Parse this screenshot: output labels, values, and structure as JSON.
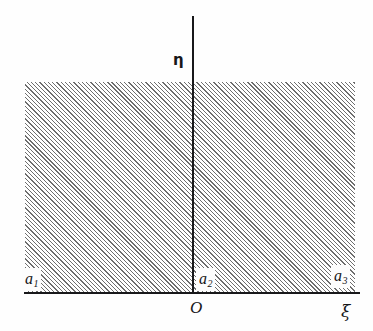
{
  "figure": {
    "type": "coordinate-plane-diagram",
    "background_color": "#fefefe",
    "hatch_color": "#6e6e6e",
    "axis_color": "#18181a"
  },
  "axes": {
    "horizontal": {
      "label": "ξ",
      "name": "xi-axis"
    },
    "vertical": {
      "label": "η",
      "name": "eta-axis"
    },
    "origin": {
      "label": "O"
    }
  },
  "regions": [
    {
      "id": "a1",
      "base": "a",
      "subscript": "1"
    },
    {
      "id": "a2",
      "base": "a",
      "subscript": "2"
    },
    {
      "id": "a3",
      "base": "a",
      "subscript": "3"
    }
  ]
}
